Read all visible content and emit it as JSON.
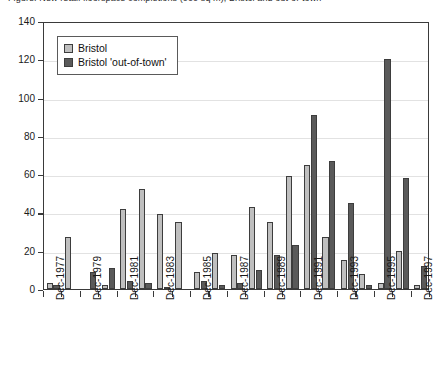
{
  "chart_data": {
    "type": "bar",
    "title": "",
    "xlabel": "",
    "ylabel": "",
    "ylim": [
      0,
      140
    ],
    "ytick_step": 20,
    "yticks": [
      0,
      20,
      40,
      60,
      80,
      100,
      120,
      140
    ],
    "grid": true,
    "legend_position": "top-left",
    "categories": [
      "Dec-1977",
      "Dec-1978",
      "Dec-1979",
      "Dec-1980",
      "Dec-1981",
      "Dec-1982",
      "Dec-1983",
      "Dec-1984",
      "Dec-1985",
      "Dec-1986",
      "Dec-1987",
      "Dec-1988",
      "Dec-1989",
      "Dec-1990",
      "Dec-1991",
      "Dec-1992",
      "Dec-1993",
      "Dec-1994",
      "Dec-1995",
      "Dec-1996",
      "Dec-1997"
    ],
    "xtick_labels": [
      "Dec-1977",
      "",
      "Dec-1979",
      "",
      "Dec-1981",
      "",
      "Dec-1983",
      "",
      "Dec-1985",
      "",
      "Dec-1987",
      "",
      "Dec-1989",
      "",
      "Dec-1991",
      "",
      "Dec-1993",
      "",
      "Dec-1995",
      "",
      "Dec-1997"
    ],
    "series": [
      {
        "name": "Bristol",
        "color": "#bfbfbf",
        "values": [
          3,
          27,
          0,
          2,
          42,
          52,
          39,
          35,
          9,
          19,
          18,
          43,
          35,
          59,
          65,
          27,
          15,
          8,
          3,
          20,
          2
        ]
      },
      {
        "name": "Bristol 'out-of-town'",
        "color": "#5a5a5a",
        "values": [
          2,
          0,
          9,
          11,
          4,
          3,
          1,
          0,
          4,
          2,
          3,
          10,
          18,
          23,
          91,
          67,
          45,
          2,
          120,
          58,
          12
        ]
      }
    ]
  },
  "legend": {
    "items": [
      {
        "label": "Bristol",
        "color": "#bfbfbf"
      },
      {
        "label": "Bristol 'out-of-town'",
        "color": "#5a5a5a"
      }
    ]
  },
  "title_sliver": {
    "text": "Figure: New retail floorspace completions (000 sq m), Bristol and out-of-town"
  }
}
